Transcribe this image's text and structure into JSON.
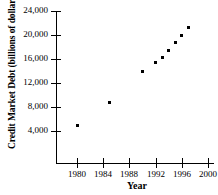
{
  "chart_data": {
    "type": "scatter",
    "title": "",
    "xlabel": "Year",
    "ylabel": "Credit Market Debt (billions of dollars)",
    "xlim": [
      1978,
      2000
    ],
    "ylim": [
      0,
      24000
    ],
    "xticks": [
      1980,
      1984,
      1988,
      1992,
      1996,
      2000
    ],
    "xtick_labels": [
      "1980",
      "1984",
      "1988",
      "1992",
      "1996",
      "2000"
    ],
    "yticks": [
      4000,
      8000,
      12000,
      16000,
      20000,
      24000
    ],
    "ytick_labels": [
      "4,000",
      "8,000",
      "12,000",
      "16,000",
      "20,000",
      "24,000"
    ],
    "grid": false,
    "legend": null,
    "marker": "square",
    "marker_color": "#000000",
    "x": [
      1980,
      1985,
      1990,
      1992,
      1993,
      1994,
      1995,
      1996,
      1997
    ],
    "y": [
      4900,
      8700,
      14000,
      15500,
      16300,
      17500,
      18700,
      19900,
      21300
    ],
    "points": [
      {
        "x": 1980,
        "y": 4900
      },
      {
        "x": 1985,
        "y": 8700
      },
      {
        "x": 1990,
        "y": 14000
      },
      {
        "x": 1992,
        "y": 15500
      },
      {
        "x": 1993,
        "y": 16300
      },
      {
        "x": 1994,
        "y": 17500
      },
      {
        "x": 1995,
        "y": 18700
      },
      {
        "x": 1996,
        "y": 19900
      },
      {
        "x": 1997,
        "y": 21300
      }
    ]
  }
}
